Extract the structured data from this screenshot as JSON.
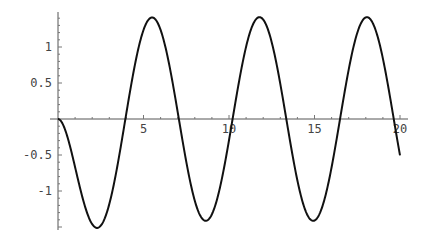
{
  "chart_data": {
    "type": "line",
    "title": "",
    "xlabel": "",
    "ylabel": "",
    "function": "cos(x) - sin(x) - exp(-x)",
    "xlim": [
      0,
      20
    ],
    "ylim": [
      -1.54,
      1.47
    ],
    "grid": false,
    "legend": null,
    "x_ticks": [
      {
        "value": 5,
        "label": "5"
      },
      {
        "value": 10,
        "label": "10"
      },
      {
        "value": 15,
        "label": "15"
      },
      {
        "value": 20,
        "label": "20"
      }
    ],
    "y_ticks": [
      {
        "value": 1,
        "label": "1"
      },
      {
        "value": 0.5,
        "label": "0.5"
      },
      {
        "value": -0.5,
        "label": "-0.5"
      },
      {
        "value": -1,
        "label": "-1"
      }
    ],
    "series": [
      {
        "name": "f(x)",
        "color": "#111111",
        "key_points": [
          {
            "x": 0,
            "y": 0
          },
          {
            "x": 2.3,
            "y": -1.4
          },
          {
            "x": 3.9,
            "y": 0
          },
          {
            "x": 5.5,
            "y": 1.41
          },
          {
            "x": 7.1,
            "y": 0
          },
          {
            "x": 8.6,
            "y": -1.41
          },
          {
            "x": 10.2,
            "y": 0
          },
          {
            "x": 11.8,
            "y": 1.41
          },
          {
            "x": 13.4,
            "y": 0
          },
          {
            "x": 14.9,
            "y": -1.41
          },
          {
            "x": 16.5,
            "y": 0
          },
          {
            "x": 18.1,
            "y": 1.41
          },
          {
            "x": 19.6,
            "y": 0
          },
          {
            "x": 20,
            "y": -0.51
          }
        ]
      }
    ]
  },
  "layout": {
    "origin_px": [
      58,
      119
    ],
    "px_per_x": 17.1,
    "px_per_y": 72,
    "y_axis_top_px": 12,
    "y_axis_bottom_px": 230,
    "x_axis_left_px": 50,
    "x_axis_right_px": 408
  }
}
